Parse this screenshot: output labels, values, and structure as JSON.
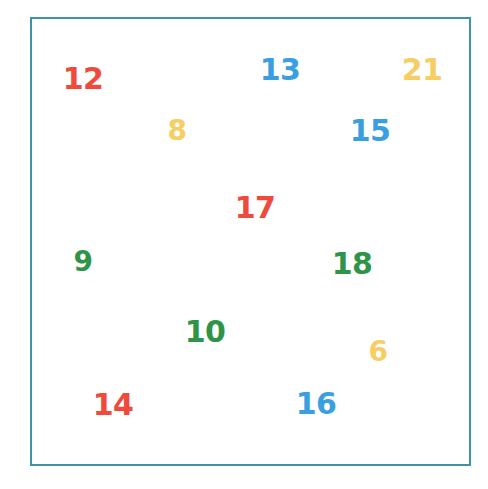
{
  "canvas": {
    "width": 488,
    "height": 489,
    "background_color": "#ffffff"
  },
  "frame": {
    "name": "border-frame",
    "border_color": "#3e93a8",
    "border_width_px": 2,
    "left": 30,
    "top": 17,
    "width": 441,
    "height": 449
  },
  "palette": {
    "red": "#ef4a3c",
    "blue": "#3a9fe0",
    "yellow": "#f7ce63",
    "green": "#2e9448",
    "frame_teal": "#3e93a8",
    "background": "#ffffff"
  },
  "chart_data": {
    "type": "scatter",
    "title": "",
    "subtitle": "",
    "xlabel": "",
    "ylabel": "",
    "xlim": [
      0,
      488
    ],
    "ylim": [
      0,
      489
    ],
    "grid": false,
    "legend": "none",
    "note": "Scattered colored number labels placed inside a teal rectangular frame; y measured downward from top edge in pixels.",
    "series": [
      {
        "name": "red",
        "color": "#ef4a3c",
        "values": [
          12,
          17,
          14
        ],
        "points": [
          {
            "label": "12",
            "x": 83,
            "y": 79
          },
          {
            "label": "17",
            "x": 255,
            "y": 208
          },
          {
            "label": "14",
            "x": 113,
            "y": 405
          }
        ]
      },
      {
        "name": "blue",
        "color": "#3a9fe0",
        "values": [
          13,
          15,
          16
        ],
        "points": [
          {
            "label": "13",
            "x": 280,
            "y": 70
          },
          {
            "label": "15",
            "x": 370,
            "y": 131
          },
          {
            "label": "16",
            "x": 316,
            "y": 404
          }
        ]
      },
      {
        "name": "yellow",
        "color": "#f7ce63",
        "values": [
          21,
          8,
          6
        ],
        "points": [
          {
            "label": "21",
            "x": 422,
            "y": 70
          },
          {
            "label": "8",
            "x": 177,
            "y": 131
          },
          {
            "label": "6",
            "x": 378,
            "y": 352
          }
        ]
      },
      {
        "name": "green",
        "color": "#2e9448",
        "values": [
          9,
          18,
          10
        ],
        "points": [
          {
            "label": "9",
            "x": 83,
            "y": 262
          },
          {
            "label": "18",
            "x": 352,
            "y": 264
          },
          {
            "label": "10",
            "x": 205,
            "y": 332
          }
        ]
      }
    ]
  },
  "tokens": [
    {
      "id": "token-12",
      "label": "12",
      "color_name": "red",
      "color": "#ef4a3c",
      "x": 83,
      "y": 79,
      "font_size": 30
    },
    {
      "id": "token-13",
      "label": "13",
      "color_name": "blue",
      "color": "#3a9fe0",
      "x": 280,
      "y": 70,
      "font_size": 30
    },
    {
      "id": "token-21",
      "label": "21",
      "color_name": "yellow",
      "color": "#f7ce63",
      "x": 422,
      "y": 70,
      "font_size": 30
    },
    {
      "id": "token-8",
      "label": "8",
      "color_name": "yellow",
      "color": "#f7ce63",
      "x": 177,
      "y": 131,
      "font_size": 28
    },
    {
      "id": "token-15",
      "label": "15",
      "color_name": "blue",
      "color": "#3a9fe0",
      "x": 370,
      "y": 131,
      "font_size": 30
    },
    {
      "id": "token-17",
      "label": "17",
      "color_name": "red",
      "color": "#ef4a3c",
      "x": 255,
      "y": 208,
      "font_size": 30
    },
    {
      "id": "token-9",
      "label": "9",
      "color_name": "green",
      "color": "#2e9448",
      "x": 83,
      "y": 262,
      "font_size": 28
    },
    {
      "id": "token-18",
      "label": "18",
      "color_name": "green",
      "color": "#2e9448",
      "x": 352,
      "y": 264,
      "font_size": 30
    },
    {
      "id": "token-10",
      "label": "10",
      "color_name": "green",
      "color": "#2e9448",
      "x": 205,
      "y": 332,
      "font_size": 30
    },
    {
      "id": "token-6",
      "label": "6",
      "color_name": "yellow",
      "color": "#f7ce63",
      "x": 378,
      "y": 352,
      "font_size": 28
    },
    {
      "id": "token-14",
      "label": "14",
      "color_name": "red",
      "color": "#ef4a3c",
      "x": 113,
      "y": 405,
      "font_size": 30
    },
    {
      "id": "token-16",
      "label": "16",
      "color_name": "blue",
      "color": "#3a9fe0",
      "x": 316,
      "y": 404,
      "font_size": 30
    }
  ]
}
